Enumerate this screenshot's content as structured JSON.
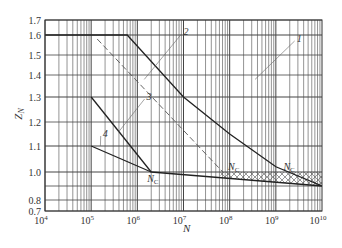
{
  "chart_data": {
    "type": "line",
    "title": "",
    "xlabel": "N",
    "ylabel": "Z_N",
    "xscale": "log",
    "xlim": [
      10000,
      10000000000
    ],
    "ylim": [
      0.7,
      1.7
    ],
    "grid": true,
    "x_tick_labels": [
      "10^4",
      "10^5",
      "10^6",
      "10^7",
      "10^8",
      "10^9",
      "10^10"
    ],
    "y_tick_labels": [
      "0.7",
      "0.8",
      "1.0",
      "1.1",
      "1.2",
      "1.3",
      "1.4",
      "1.5",
      "1.6",
      "1.7"
    ],
    "y_gridlines": [
      0.7,
      0.8,
      0.9,
      1.0,
      1.1,
      1.2,
      1.3,
      1.4,
      1.5,
      1.6,
      1.7
    ],
    "series": [
      {
        "name": "1",
        "style": "solid",
        "points": [
          [
            4.0,
            1.6
          ],
          [
            5.78,
            1.6
          ],
          [
            7.0,
            1.3
          ],
          [
            8.0,
            1.15
          ],
          [
            9.0,
            1.02
          ],
          [
            10.0,
            0.9
          ]
        ]
      },
      {
        "name": "2",
        "style": "dashed",
        "points": [
          [
            5.13,
            1.58
          ],
          [
            7.85,
            1.0
          ]
        ]
      },
      {
        "name": "3",
        "style": "solid",
        "points": [
          [
            5.0,
            1.3
          ],
          [
            6.3,
            1.0
          ]
        ]
      },
      {
        "name": "4",
        "style": "solid",
        "points": [
          [
            5.0,
            1.1
          ],
          [
            6.3,
            1.0
          ]
        ]
      },
      {
        "name": "common",
        "style": "solid",
        "points": [
          [
            6.3,
            1.0
          ],
          [
            10.0,
            0.9
          ]
        ]
      }
    ],
    "annotations": [
      {
        "text": "1",
        "x": 9.45,
        "y": 1.58
      },
      {
        "text": "2",
        "x": 7.0,
        "y": 1.62
      },
      {
        "text": "3",
        "x": 6.2,
        "y": 1.3
      },
      {
        "text": "4",
        "x": 5.25,
        "y": 1.15
      },
      {
        "text": "N_C",
        "x": 6.3,
        "y": 0.95
      },
      {
        "text": "N_C",
        "x": 8.05,
        "y": 1.02
      },
      {
        "text": "N_C",
        "x": 9.25,
        "y": 1.02
      }
    ],
    "hatched_region": {
      "x_from": 7.8,
      "x_to": 10.0,
      "y_upper": 1.0,
      "y_lower": "common line"
    }
  }
}
